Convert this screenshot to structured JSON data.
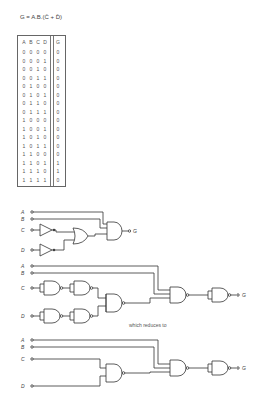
{
  "equation": "G = A.B.(C̄ + D̄)",
  "truth_table": {
    "headers": [
      "A",
      "B",
      "C",
      "D",
      "G"
    ],
    "rows": [
      [
        "0",
        "0",
        "0",
        "0",
        "0"
      ],
      [
        "0",
        "0",
        "0",
        "1",
        "0"
      ],
      [
        "0",
        "0",
        "1",
        "0",
        "0"
      ],
      [
        "0",
        "0",
        "1",
        "1",
        "0"
      ],
      [
        "0",
        "1",
        "0",
        "0",
        "0"
      ],
      [
        "0",
        "1",
        "0",
        "1",
        "0"
      ],
      [
        "0",
        "1",
        "1",
        "0",
        "0"
      ],
      [
        "0",
        "1",
        "1",
        "1",
        "0"
      ],
      [
        "1",
        "0",
        "0",
        "0",
        "0"
      ],
      [
        "1",
        "0",
        "0",
        "1",
        "0"
      ],
      [
        "1",
        "0",
        "1",
        "0",
        "0"
      ],
      [
        "1",
        "0",
        "1",
        "1",
        "0"
      ],
      [
        "1",
        "1",
        "0",
        "0",
        "0"
      ],
      [
        "1",
        "1",
        "0",
        "1",
        "1"
      ],
      [
        "1",
        "1",
        "1",
        "0",
        "1"
      ],
      [
        "1",
        "1",
        "1",
        "1",
        "0"
      ]
    ]
  },
  "circuits": {
    "inputs": [
      "A",
      "B",
      "C",
      "D"
    ],
    "output": "G",
    "transition_text": "which reduces to"
  }
}
